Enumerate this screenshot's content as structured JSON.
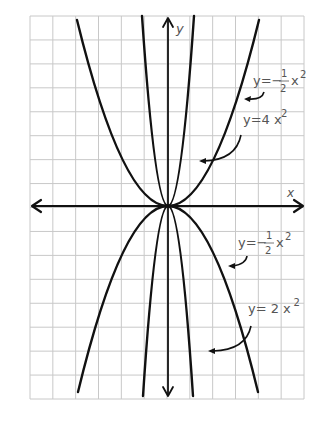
{
  "chart_data": {
    "type": "line",
    "title": "",
    "xlabel": "x",
    "ylabel": "y",
    "grid": true,
    "grid_color": "#c8c8c8",
    "curve_color": "#111111",
    "label_color": "#555555",
    "axes": {
      "origin_px": [
        168,
        206
      ],
      "x_axis_px": [
        32,
        303
      ],
      "y_axis_px": [
        18,
        396
      ]
    },
    "grid_px": {
      "left": 30,
      "right": 304,
      "top": 16,
      "bottom": 399,
      "cols": 12,
      "rows": 16
    },
    "series": [
      {
        "name": "y=1/2 x^2 (upward, wide)",
        "direction": "up",
        "half_width_px": 91,
        "height_px": 186
      },
      {
        "name": "y=4x^2 (upward, narrow)",
        "direction": "up",
        "half_width_px": 26,
        "height_px": 190
      },
      {
        "name": "y=-1/2 x^2 (downward, wide)",
        "direction": "down",
        "half_width_px": 90,
        "height_px": 186
      },
      {
        "name": "y=-4x^2 (downward, narrow)",
        "direction": "down",
        "half_width_px": 25,
        "height_px": 190
      }
    ],
    "annotations": [
      {
        "id": "lbl1",
        "text_main": "y=−",
        "frac_num": "1",
        "frac_den": "2",
        "text_tail": "x",
        "sup": "2",
        "pos": [
          253,
          85
        ]
      },
      {
        "id": "lbl2",
        "text_main": "y=4 x",
        "sup": "2",
        "pos": [
          243,
          124
        ]
      },
      {
        "id": "lbl3",
        "text_main": "y=−",
        "frac_num": "1",
        "frac_den": "2",
        "text_tail": "x",
        "sup": "2",
        "pos": [
          238,
          247
        ]
      },
      {
        "id": "lbl4",
        "text_main": "y= 2 x",
        "sup": "2",
        "pos": [
          248,
          313
        ]
      }
    ],
    "axis_labels": {
      "x": "x",
      "y": "y"
    }
  }
}
